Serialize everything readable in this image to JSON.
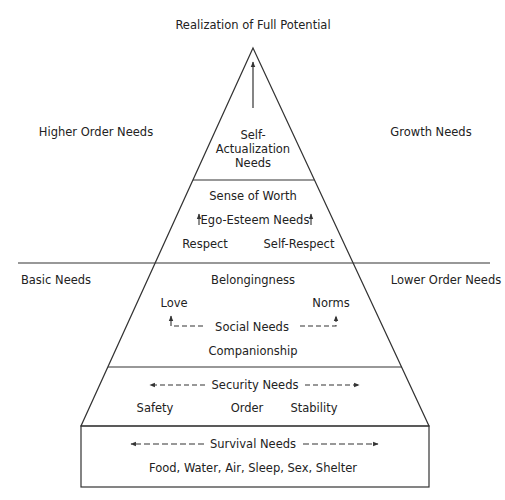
{
  "title": "Realization of Full Potential",
  "side_labels": {
    "upper_left": "Higher Order Needs",
    "upper_right": "Growth Needs",
    "lower_left": "Basic Needs",
    "lower_right": "Lower Order Needs"
  },
  "levels": [
    {
      "id": "self-actualization",
      "label_lines": [
        "Self-",
        "Actualization",
        "Needs"
      ],
      "arrow": "up"
    },
    {
      "id": "ego-esteem",
      "heading": "Sense of Worth",
      "label": "Ego-Esteem Needs",
      "items": [
        "Respect",
        "Self-Respect"
      ],
      "arrows": "up-both-sides"
    },
    {
      "id": "social",
      "heading": "Belongingness",
      "label": "Social Needs",
      "items_left": "Love",
      "items_right": "Norms",
      "footer": "Companionship",
      "arrows": "dashed-elbow-up"
    },
    {
      "id": "security",
      "label": "Security Needs",
      "items": [
        "Safety",
        "Order",
        "Stability"
      ],
      "arrows": "dashed-left-right"
    },
    {
      "id": "survival",
      "label": "Survival Needs",
      "items_text": "Food, Water, Air, Sleep, Sex, Shelter",
      "arrows": "dashed-left-right"
    }
  ],
  "colors": {
    "line": "#333333",
    "text": "#222222",
    "background": "#ffffff"
  }
}
